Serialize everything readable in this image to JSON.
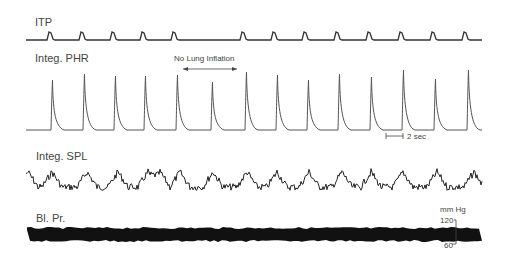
{
  "chart_data": {
    "type": "line",
    "title": "",
    "traces": [
      {
        "name": "ITP",
        "label": "ITP",
        "peaks_x": [
          50,
          82,
          113,
          143,
          174,
          243,
          274,
          305,
          337,
          369,
          401,
          433,
          465
        ],
        "baseline_y": 40,
        "peak_height": 8
      },
      {
        "name": "Integ. PHR",
        "label": "Integ. PHR",
        "peaks_x": [
          52,
          84,
          115,
          145,
          177,
          212,
          246,
          277,
          308,
          339,
          371,
          403,
          435,
          468
        ],
        "peak_y": [
          80,
          74,
          76,
          76,
          75,
          82,
          72,
          75,
          80,
          74,
          77,
          70,
          79,
          70
        ],
        "baseline_y": 130
      },
      {
        "name": "Integ. SPL",
        "label": "Integ. SPL",
        "baseline_y": 185,
        "type": "noisy oscillation"
      },
      {
        "name": "Bl. Pr.",
        "label": "Bl. Pr.",
        "band_top": 228,
        "band_bottom": 240,
        "type": "dense band"
      }
    ],
    "annotations": [
      {
        "text": "No Lung Inflation",
        "type": "double-arrow",
        "x_from": 180,
        "x_to": 240
      },
      {
        "text": "2 sec",
        "type": "time-scale-bar"
      },
      {
        "text": "mm Hg",
        "type": "unit"
      },
      {
        "text": "120",
        "type": "scale-tick"
      },
      {
        "text": "60",
        "type": "scale-tick"
      }
    ],
    "xlabel": "",
    "ylabel": "",
    "grid": false,
    "legend": "none"
  },
  "labels": {
    "itp": "ITP",
    "phr": "Integ. PHR",
    "spl": "Integ. SPL",
    "bp": "Bl. Pr.",
    "no_lung": "No Lung Inflation",
    "time_scale": "2 sec",
    "unit": "mm Hg",
    "tick_high": "120",
    "tick_low": "60"
  }
}
